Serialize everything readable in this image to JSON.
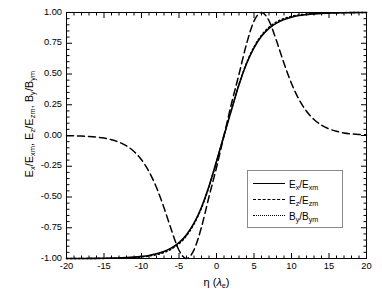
{
  "chart_data": {
    "type": "line",
    "title": "",
    "xlabel": "η (λ_e)",
    "ylabel": "E_x/E_xm, E_z/E_zm, B_y/B_ym",
    "xlim": [
      -20,
      20
    ],
    "ylim": [
      -1.0,
      1.0
    ],
    "grid": false,
    "legend_position": "center-right",
    "xticks": [
      "-20",
      "-15",
      "-10",
      "-5",
      "0",
      "5",
      "10",
      "15",
      "20"
    ],
    "xtick_values": [
      -20,
      -15,
      -10,
      -5,
      0,
      5,
      10,
      15,
      20
    ],
    "xminor_per_interval": 5,
    "yticks": [
      "1.00",
      "0.75",
      "0.50",
      "0.25",
      "0.00",
      "-0.25",
      "-0.50",
      "-0.75",
      "-1.00"
    ],
    "ytick_values": [
      1.0,
      0.75,
      0.5,
      0.25,
      0.0,
      -0.25,
      -0.5,
      -0.75,
      -1.0
    ],
    "yminor_per_interval": 5,
    "x": [
      -20,
      -19,
      -18,
      -17,
      -16,
      -15,
      -14,
      -13,
      -12,
      -11,
      -10,
      -9,
      -8,
      -7,
      -6,
      -5,
      -4,
      -3,
      -2,
      -1,
      0,
      1,
      2,
      3,
      4,
      5,
      6,
      7,
      8,
      9,
      10,
      11,
      12,
      13,
      14,
      15,
      16,
      17,
      18,
      19,
      20
    ],
    "series": [
      {
        "name": "E_x/E_xm",
        "style": "solid",
        "color": "#000000",
        "values": [
          -1.0,
          -1.0,
          -1.0,
          -0.999,
          -0.999,
          -0.998,
          -0.997,
          -0.995,
          -0.993,
          -0.989,
          -0.983,
          -0.975,
          -0.962,
          -0.943,
          -0.914,
          -0.871,
          -0.806,
          -0.713,
          -0.583,
          -0.413,
          -0.21,
          0.0,
          0.21,
          0.413,
          0.583,
          0.713,
          0.806,
          0.871,
          0.914,
          0.943,
          0.962,
          0.975,
          0.983,
          0.989,
          0.993,
          0.995,
          0.997,
          0.998,
          0.999,
          1.0,
          1.0
        ]
      },
      {
        "name": "E_z/E_zm",
        "style": "dashed",
        "color": "#000000",
        "values": [
          -0.002,
          -0.003,
          -0.005,
          -0.008,
          -0.013,
          -0.021,
          -0.034,
          -0.054,
          -0.084,
          -0.13,
          -0.197,
          -0.293,
          -0.423,
          -0.587,
          -0.77,
          -0.933,
          -1.0,
          -0.93,
          -0.744,
          -0.498,
          -0.26,
          0.0,
          0.26,
          0.498,
          0.744,
          0.93,
          1.0,
          0.933,
          0.77,
          0.587,
          0.423,
          0.293,
          0.197,
          0.13,
          0.084,
          0.054,
          0.034,
          0.021,
          0.013,
          0.008,
          0.005
        ]
      },
      {
        "name": "B_y/B_ym",
        "style": "dotted",
        "color": "#000000",
        "values": [
          -1.0,
          -1.0,
          -1.0,
          -1.0,
          -0.999,
          -0.999,
          -0.998,
          -0.997,
          -0.995,
          -0.992,
          -0.987,
          -0.98,
          -0.969,
          -0.951,
          -0.923,
          -0.88,
          -0.815,
          -0.72,
          -0.589,
          -0.416,
          -0.212,
          0.0,
          0.212,
          0.416,
          0.589,
          0.72,
          0.815,
          0.88,
          0.923,
          0.951,
          0.969,
          0.98,
          0.987,
          0.992,
          0.995,
          0.997,
          0.998,
          0.999,
          1.0,
          1.0,
          1.0
        ]
      }
    ],
    "annotations": []
  },
  "axes": {
    "ylabel_parts": {
      "p1": "E",
      "s1": "x",
      "p2": "/E",
      "s2": "xm",
      "sep1": ",  ",
      "p3": "E",
      "s3": "z",
      "p4": "/E",
      "s4": "zm",
      "sep2": ",  ",
      "p5": "B",
      "s5": "y",
      "p6": "/B",
      "s6": "ym"
    },
    "xlabel_parts": {
      "eta": "η",
      "open": " (",
      "lam": "λ",
      "sub": "e",
      "close": ")"
    },
    "ytick_labels": [
      "1.00",
      "0.75",
      "0.50",
      "0.25",
      "0.00",
      "-0.25",
      "-0.50",
      "-0.75",
      "-1.00"
    ],
    "xtick_labels": [
      "-20",
      "-15",
      "-10",
      "-5",
      "0",
      "5",
      "10",
      "15",
      "20"
    ]
  },
  "legend": {
    "items": [
      {
        "style": "solid",
        "num": "E",
        "num_sub": "x",
        "den": "/E",
        "den_sub": "xm"
      },
      {
        "style": "dashed",
        "num": "E",
        "num_sub": "z",
        "den": "/E",
        "den_sub": "zm"
      },
      {
        "style": "dotted",
        "num": "B",
        "num_sub": "y",
        "den": "/B",
        "den_sub": "ym"
      }
    ]
  },
  "colors": {
    "axis": "#000000",
    "frame": "#000000",
    "legend_border": "#8a8a8a",
    "background": "#ffffff"
  }
}
